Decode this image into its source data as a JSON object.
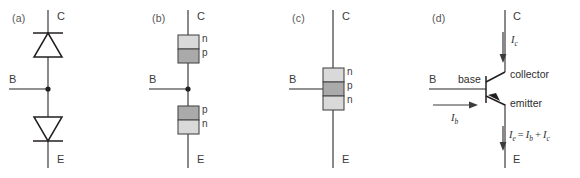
{
  "figure": {
    "background": "#ffffff",
    "colors": {
      "wire": "#6d6b6e",
      "symbol": "#231f20",
      "n_region": "#d9d9d9",
      "p_region": "#aaaaaa",
      "text": "#3b3a3c"
    }
  },
  "panels": [
    {
      "key": "a",
      "label": "(a)",
      "terminals": {
        "collector": "C",
        "base": "B",
        "emitter": "E"
      },
      "description": "two-diode-equivalent"
    },
    {
      "key": "b",
      "label": "(b)",
      "terminals": {
        "collector": "C",
        "base": "B",
        "emitter": "E"
      },
      "upper_box": {
        "top": "n",
        "bottom": "p"
      },
      "lower_box": {
        "top": "p",
        "bottom": "n"
      },
      "description": "two-diode-np-regions"
    },
    {
      "key": "c",
      "label": "(c)",
      "terminals": {
        "collector": "C",
        "base": "B",
        "emitter": "E"
      },
      "layers": {
        "top": "n",
        "middle": "p",
        "bottom": "n"
      },
      "description": "npn-merged-structure"
    },
    {
      "key": "d",
      "label": "(d)",
      "terminals": {
        "collector": "C",
        "base": "B",
        "emitter": "E"
      },
      "parts": {
        "collector": "collector",
        "base": "base",
        "emitter": "emitter"
      },
      "currents": {
        "collector_current": {
          "symbol": "I",
          "sub": "c"
        },
        "base_current": {
          "symbol": "I",
          "sub": "b"
        },
        "emitter_current": {
          "symbol": "I",
          "sub": "e",
          "equals": "=",
          "term1_symbol": "I",
          "term1_sub": "b",
          "plus": "+",
          "term2_symbol": "I",
          "term2_sub": "c"
        }
      },
      "description": "npn-transistor-symbol-with-currents"
    }
  ]
}
